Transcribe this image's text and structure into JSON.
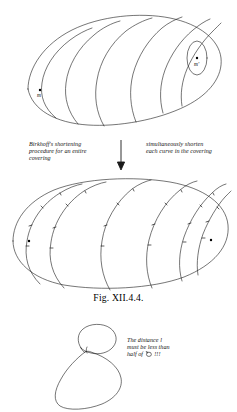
{
  "figure": {
    "caption": "Fig. XII.4.4.",
    "background_color": "#ffffff",
    "ink_color": "#1a1a1a"
  },
  "annotations": {
    "left": {
      "line1": "Birkhoff's shortening",
      "line2": "procedure for an entire",
      "line3": "covering"
    },
    "right": {
      "line1": "simultaneously shorten",
      "line2": "each curve in the covering"
    },
    "bottom": {
      "line1": "The distance l",
      "line2": "must be less than",
      "line3_prefix": "half of",
      "line3_symbol": "systole-loop-symbol",
      "line3_suffix": "!!!"
    },
    "arrow": "down-arrow"
  },
  "top_figure": {
    "name": "egg-surface-with-covering-curves",
    "point_left_label": "m",
    "point_right_label": "m'",
    "curve_count": 6
  },
  "middle_figure": {
    "name": "egg-surface-shortened-covering-curves",
    "point_left_label": "m",
    "point_right_label": "m'",
    "curve_count": 6
  },
  "bottom_figure": {
    "name": "pinched-figure-eight-curve"
  }
}
